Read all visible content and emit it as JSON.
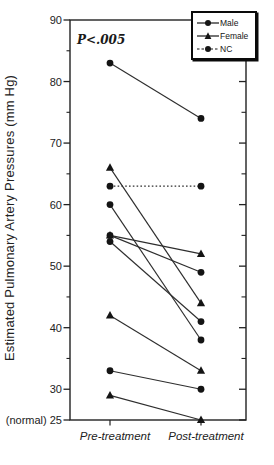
{
  "figure": {
    "background": "#ffffff",
    "ink_color": "#222222"
  },
  "legend": {
    "items": [
      {
        "label": "Male",
        "marker": "circle",
        "line": "solid"
      },
      {
        "label": "Female",
        "marker": "triangle",
        "line": "solid"
      },
      {
        "label": "NC",
        "marker": "circle",
        "line": "dashed"
      }
    ]
  },
  "chart_data": {
    "type": "line",
    "title": "",
    "ylabel": "Estimated Pulmonary Artery Pressures (mm Hg)",
    "xlabel": "",
    "annotation": "P<.005",
    "categories": [
      "Pre-treatment",
      "Post-treatment"
    ],
    "ylim": [
      25,
      90
    ],
    "y_ticks_major": [
      90,
      80,
      70,
      60,
      50,
      40,
      30,
      25
    ],
    "y_ticks_minor": [
      85,
      75,
      65,
      55,
      45,
      35
    ],
    "y_tick_25_label": "(normal) 25",
    "grid": false,
    "legend_position": "top-right",
    "series": [
      {
        "name": "Male",
        "marker": "circle",
        "style": "solid",
        "pairs": [
          [
            83,
            74
          ],
          [
            60,
            38
          ],
          [
            55,
            49
          ],
          [
            54,
            41
          ],
          [
            33,
            30
          ]
        ]
      },
      {
        "name": "Female",
        "marker": "triangle",
        "style": "solid",
        "pairs": [
          [
            66,
            44
          ],
          [
            55,
            52
          ],
          [
            42,
            33
          ],
          [
            29,
            25
          ]
        ]
      },
      {
        "name": "NC",
        "marker": "circle",
        "style": "dotted",
        "pairs": [
          [
            63,
            63
          ]
        ]
      }
    ]
  }
}
